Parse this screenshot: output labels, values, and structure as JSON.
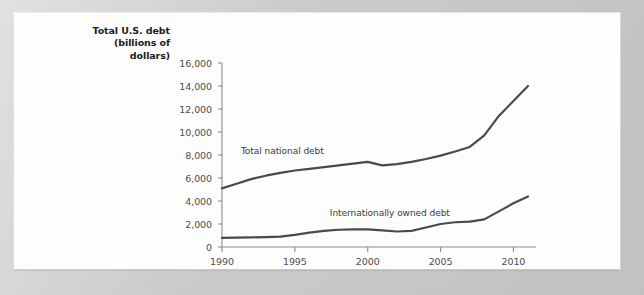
{
  "chart_data": {
    "type": "line",
    "title": "",
    "ylabel": "Total U.S. debt (billions of dollars)",
    "ylabel_lines": [
      "Total U.S. debt",
      "(billions of",
      "dollars)"
    ],
    "xlabel": "",
    "ylim": [
      0,
      16000
    ],
    "xlim": [
      1990,
      2011
    ],
    "yticks": [
      0,
      2000,
      4000,
      6000,
      8000,
      10000,
      12000,
      14000,
      16000
    ],
    "ytick_labels": [
      "0",
      "2,000",
      "4,000",
      "6,000",
      "8,000",
      "10,000",
      "12,000",
      "14,000",
      "16,000"
    ],
    "xticks": [
      1990,
      1995,
      2000,
      2005,
      2010
    ],
    "xtick_labels": [
      "1990",
      "1995",
      "2000",
      "2005",
      "2010"
    ],
    "grid": false,
    "legend_position": "inline-annotation",
    "line_color": "#4a4a4a",
    "axis_color": "#8c8c8c",
    "x": [
      1990,
      1991,
      1992,
      1993,
      1994,
      1995,
      1996,
      1997,
      1998,
      1999,
      2000,
      2001,
      2002,
      2003,
      2004,
      2005,
      2006,
      2007,
      2008,
      2009,
      2010,
      2011
    ],
    "series": [
      {
        "name": "Total national debt",
        "label": "Total national debt",
        "label_x": 1991.3,
        "label_y": 8300,
        "values": [
          5100,
          5500,
          5900,
          6200,
          6450,
          6650,
          6800,
          6950,
          7100,
          7250,
          7400,
          7100,
          7200,
          7400,
          7650,
          7950,
          8300,
          8700,
          9700,
          11400,
          12700,
          14000
        ]
      },
      {
        "name": "Internationally owned debt",
        "label": "Internationally owned debt",
        "label_x": 1997.4,
        "label_y": 2850,
        "values": [
          800,
          820,
          840,
          860,
          900,
          1050,
          1250,
          1400,
          1500,
          1530,
          1540,
          1450,
          1350,
          1400,
          1700,
          2000,
          2150,
          2200,
          2400,
          3100,
          3800,
          4400
        ]
      }
    ]
  },
  "annotations": {
    "top_series_label": "Total national debt",
    "bottom_series_label": "Internationally owned debt"
  }
}
